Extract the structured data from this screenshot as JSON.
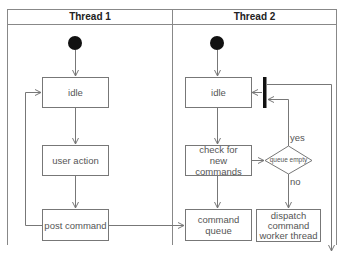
{
  "diagram": {
    "type": "uml-activity-diagram",
    "swimlanes": [
      {
        "title": "Thread 1",
        "nodes": [
          {
            "id": "t1-start",
            "kind": "initial"
          },
          {
            "id": "t1-idle",
            "kind": "action",
            "label": "idle"
          },
          {
            "id": "t1-user-action",
            "kind": "action",
            "label": "user action"
          },
          {
            "id": "t1-post-command",
            "kind": "action",
            "label": "post command"
          }
        ]
      },
      {
        "title": "Thread 2",
        "nodes": [
          {
            "id": "t2-start",
            "kind": "initial"
          },
          {
            "id": "t2-idle",
            "kind": "action",
            "label": "idle"
          },
          {
            "id": "t2-join-bar",
            "kind": "join"
          },
          {
            "id": "t2-check",
            "kind": "action",
            "label_lines": [
              "check for",
              "new commands"
            ]
          },
          {
            "id": "t2-decision",
            "kind": "decision",
            "label": "queue empty"
          },
          {
            "id": "t2-command-queue",
            "kind": "action",
            "label": "command queue"
          },
          {
            "id": "t2-dispatch",
            "kind": "action",
            "label_lines": [
              "dispatch",
              "command",
              "worker thread"
            ]
          }
        ]
      }
    ],
    "edges": [
      {
        "from": "t1-start",
        "to": "t1-idle"
      },
      {
        "from": "t1-idle",
        "to": "t1-user-action"
      },
      {
        "from": "t1-user-action",
        "to": "t1-post-command"
      },
      {
        "from": "t1-post-command",
        "to": "t1-idle"
      },
      {
        "from": "t1-post-command",
        "to": "t2-command-queue"
      },
      {
        "from": "t2-start",
        "to": "t2-idle"
      },
      {
        "from": "t2-join-bar",
        "to": "t2-idle"
      },
      {
        "from": "t2-idle",
        "to": "t2-check"
      },
      {
        "from": "t2-check",
        "to": "t2-decision"
      },
      {
        "from": "t2-check",
        "to": "t2-command-queue"
      },
      {
        "from": "t2-decision",
        "to": "t2-join-bar",
        "label": "yes"
      },
      {
        "from": "t2-decision",
        "to": "t2-dispatch",
        "label": "no"
      },
      {
        "from": "t2-join-bar",
        "to": "off-diagram-bottom"
      }
    ],
    "guards": {
      "yes": "yes",
      "no": "no"
    },
    "colors": {
      "line": "#777777",
      "bar": "#111111",
      "initial": "#111111",
      "frame": "#888888"
    }
  }
}
